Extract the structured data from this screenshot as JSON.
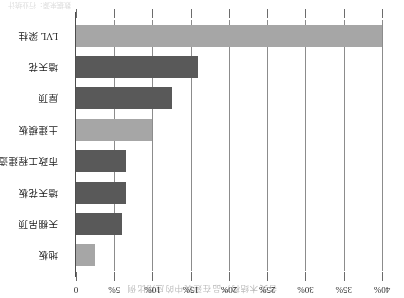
{
  "chart": {
    "title": "各类木结构产品在建筑中的应用比例",
    "footnote": "数据来源：行业统计"
  },
  "chart_data": {
    "type": "bar",
    "orientation": "horizontal",
    "title": "各类木结构产品在建筑中的应用比例",
    "xlabel": "",
    "ylabel": "",
    "xlim": [
      0,
      40
    ],
    "grid": true,
    "legend": "none",
    "value_unit": "%",
    "categories": [
      "地板",
      "天棚吊顶",
      "墙天花板",
      "市政工程建造",
      "土建模板",
      "屋顶",
      "墙天花",
      "LVL 梁柱"
    ],
    "values": [
      2.5,
      6.0,
      6.5,
      6.5,
      10.0,
      12.5,
      16.0,
      40.0
    ],
    "colors": [
      "#a6a6a6",
      "#595959",
      "#595959",
      "#595959",
      "#a6a6a6",
      "#595959",
      "#595959",
      "#a6a6a6"
    ],
    "ticks": [
      {
        "value": 0,
        "label": "0"
      },
      {
        "value": 5,
        "label": "5%"
      },
      {
        "value": 10,
        "label": "10%"
      },
      {
        "value": 15,
        "label": "15%"
      },
      {
        "value": 20,
        "label": "20%"
      },
      {
        "value": 25,
        "label": "25%"
      },
      {
        "value": 30,
        "label": "30%"
      },
      {
        "value": 35,
        "label": "35%"
      },
      {
        "value": 40,
        "label": "40%"
      }
    ]
  }
}
